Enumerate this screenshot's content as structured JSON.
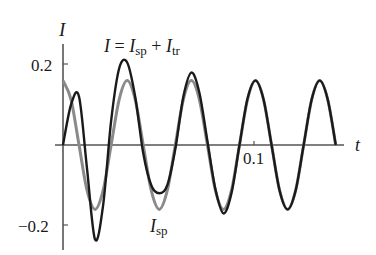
{
  "chart_data": {
    "type": "line",
    "title": "",
    "xlabel": "t",
    "ylabel": "I",
    "xlim": [
      0,
      0.145
    ],
    "ylim": [
      -0.25,
      0.25
    ],
    "grid": false,
    "legend_position": "inline annotations",
    "x_ticks": [
      {
        "value": 0.1,
        "label": "0.1"
      }
    ],
    "y_ticks": [
      {
        "value": 0.2,
        "label": "0.2"
      },
      {
        "value": -0.2,
        "label": "−0.2"
      }
    ],
    "annotations": [
      {
        "text": "I = Isp + Itr",
        "target_series": "I",
        "position": "top center"
      },
      {
        "text": "Isp",
        "target_series": "Isp",
        "position": "bottom center"
      }
    ],
    "series": [
      {
        "name": "Isp",
        "color": "#8a8a8a",
        "description": "steady-state periodic current",
        "x": [
          0,
          0.0042,
          0.0084,
          0.0126,
          0.0168,
          0.021,
          0.0252,
          0.0294,
          0.0336,
          0.0378,
          0.042,
          0.0462,
          0.0504,
          0.0546,
          0.0588,
          0.063,
          0.0672,
          0.0714,
          0.0756,
          0.0798,
          0.084,
          0.0882,
          0.0924,
          0.0966,
          0.1008,
          0.105,
          0.1092,
          0.1134,
          0.1176,
          0.1218,
          0.126,
          0.1302,
          0.1344,
          0.1386,
          0.1428
        ],
        "values": [
          0.16,
          0.113,
          0.0,
          -0.113,
          -0.16,
          -0.113,
          0.0,
          0.113,
          0.16,
          0.113,
          0.0,
          -0.113,
          -0.16,
          -0.113,
          0.0,
          0.113,
          0.16,
          0.113,
          0.0,
          -0.113,
          -0.16,
          -0.113,
          0.0,
          0.113,
          0.16,
          0.113,
          0.0,
          -0.113,
          -0.16,
          -0.113,
          0.0,
          0.113,
          0.16,
          0.113,
          0.0
        ]
      },
      {
        "name": "I",
        "color": "#1a1a1a",
        "description": "total current I = Isp + Itr",
        "x": [
          0,
          0.0042,
          0.0084,
          0.0126,
          0.0168,
          0.021,
          0.0252,
          0.0294,
          0.0336,
          0.0378,
          0.042,
          0.0462,
          0.0504,
          0.0546,
          0.0588,
          0.063,
          0.0672,
          0.0714,
          0.0756,
          0.0798,
          0.084,
          0.0882,
          0.0924,
          0.0966,
          0.1008,
          0.105,
          0.1092,
          0.1134,
          0.1176,
          0.1218,
          0.126,
          0.1302,
          0.1344,
          0.1386,
          0.1428
        ],
        "values": [
          0.0,
          0.1,
          0.12,
          -0.06,
          -0.235,
          -0.15,
          0.06,
          0.19,
          0.205,
          0.12,
          -0.02,
          -0.1,
          -0.12,
          -0.1,
          -0.01,
          0.12,
          0.18,
          0.13,
          0.01,
          -0.11,
          -0.17,
          -0.12,
          0.0,
          0.115,
          0.16,
          0.113,
          0.0,
          -0.113,
          -0.16,
          -0.113,
          0.0,
          0.113,
          0.16,
          0.113,
          0.0
        ]
      }
    ]
  },
  "labels": {
    "y_axis": "I",
    "x_axis": "t",
    "ytick_pos": "0.2",
    "ytick_neg": "−0.2",
    "xtick": "0.1",
    "ann_total_prefix": "I = I",
    "ann_total_sub1": "sp",
    "ann_total_mid": " + I",
    "ann_total_sub2": "tr",
    "ann_sp_main": "I",
    "ann_sp_sub": "sp"
  }
}
